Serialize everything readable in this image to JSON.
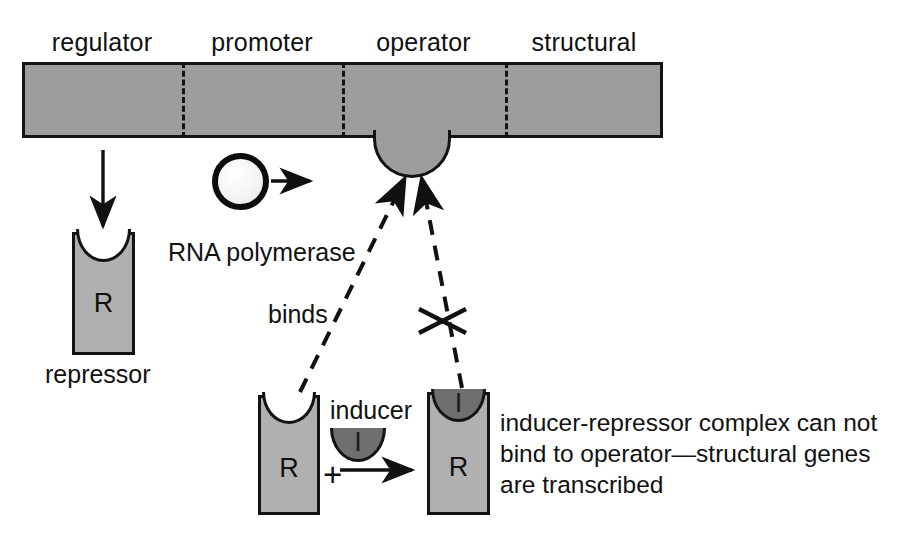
{
  "diagram": {
    "colors": {
      "dna_fill": "#9d9d9d",
      "protein_fill": "#b0b0b0",
      "inducer_fill": "#6f6f6f",
      "outline": "#131313",
      "background": "#ffffff"
    }
  },
  "dna_segments": [
    {
      "label": "regulator"
    },
    {
      "label": "promoter"
    },
    {
      "label": "operator"
    },
    {
      "label": "structural"
    }
  ],
  "molecules": {
    "rna_polymerase_label": "RNA polymerase",
    "repressor_label": "repressor",
    "repressor_glyph": "R",
    "inducer_label": "inducer",
    "inducer_glyph": "I",
    "complex_repressor_glyph": "R",
    "complex_inducer_glyph": "I",
    "plus_sign": "+"
  },
  "annotations": {
    "binds_label": "binds",
    "blocked_marker": "x-cross-no-bind",
    "outcome_text_line1": "inducer-repressor complex can not",
    "outcome_text_line2": "bind to operator—structural genes",
    "outcome_text_line3": "are transcribed"
  }
}
